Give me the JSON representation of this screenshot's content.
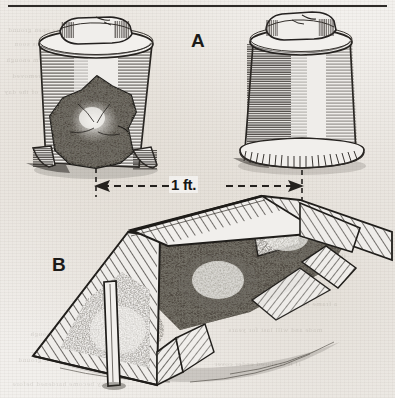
{
  "figure": {
    "top_rule": true,
    "background_color": "#f2f0ed",
    "ink_color": "#24211e",
    "panels": [
      {
        "id": "A",
        "label": "A",
        "subject": "inverted-flower-pots",
        "description": "Two inverted flower pots used as plant cloches, each weighted on top with a stone; the left pot is cut away to reveal the sheltered plant inside."
      },
      {
        "id": "B",
        "label": "B",
        "subject": "a-frame-board-cloche",
        "description": "An A-frame of boards set tent-like over a row of plants, propped by an upright stake, open at the near end."
      }
    ],
    "dimension": {
      "label": "1 ft.",
      "style": "dashed-double-arrow",
      "between": [
        "pot-left",
        "pot-right"
      ]
    }
  },
  "ghost_text": {
    "lines": [
      "of the plants in the open ground",
      "and they may be set out as soon",
      "the soil has become warm enough",
      "covering should be removed",
      "during the warmer part of the day",
      "in order that the young plants",
      "may become hardened before",
      "the boards are taken away",
      "a frame of this kind is easily",
      "made and will last for years",
      "if it is stored under cover"
    ]
  }
}
